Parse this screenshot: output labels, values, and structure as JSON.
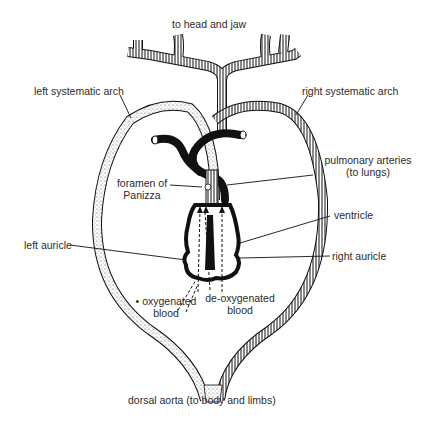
{
  "diagram": {
    "labels": {
      "top": "to head and jaw",
      "left_arch": "left systematic arch",
      "right_arch": "right systematic arch",
      "pulmonary_line1": "pulmonary arteries",
      "pulmonary_line2": "(to lungs)",
      "foramen_line1": "foramen of",
      "foramen_line2": "Panizza",
      "ventricle": "ventricle",
      "left_auricle": "left auricle",
      "right_auricle": "right auricle",
      "oxy_line1": "• oxygenated",
      "oxy_line2": "blood",
      "deoxy_line1": "de-oxygenated",
      "deoxy_line2": "blood",
      "bottom": "dorsal aorta (to body and limbs)"
    },
    "colors": {
      "ink": "#111111",
      "text": "#2b2b2b",
      "background": "#ffffff"
    }
  }
}
